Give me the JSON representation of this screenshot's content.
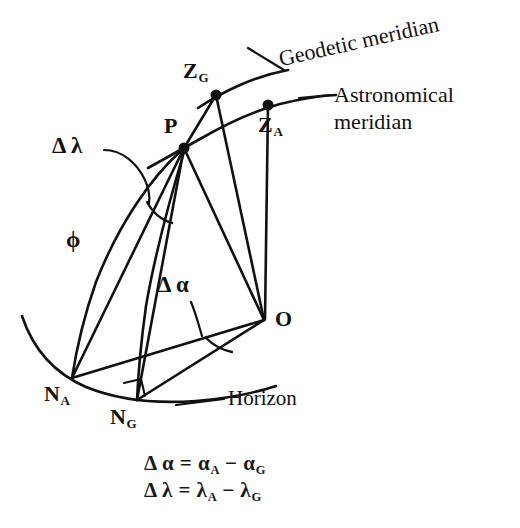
{
  "figure": {
    "background_color": "#ffffff",
    "ink_color": "#111111",
    "points": [
      {
        "id": "P",
        "label": "P",
        "sub": "",
        "x": 184,
        "y": 148
      },
      {
        "id": "ZG",
        "label": "Z",
        "sub": "G",
        "x": 216,
        "y": 95
      },
      {
        "id": "ZA",
        "label": "Z",
        "sub": "A",
        "x": 268,
        "y": 105
      },
      {
        "id": "O",
        "label": "O",
        "sub": "",
        "x": 264,
        "y": 320
      },
      {
        "id": "NA",
        "label": "N",
        "sub": "A",
        "x": 72,
        "y": 378
      },
      {
        "id": "NG",
        "label": "N",
        "sub": "G",
        "x": 137,
        "y": 400
      }
    ],
    "annotations": {
      "delta_lambda": "Δ λ",
      "delta_alpha": "Δ α",
      "phi": "ϕ"
    },
    "callouts": {
      "geodetic_meridian": "Geodetic meridian",
      "astronomical_meridian_line1": "Astronomical",
      "astronomical_meridian_line2": "meridian",
      "horizon": "Horizon"
    },
    "equations": [
      {
        "lhs_symbol": "Δ α",
        "eq": "=",
        "term1": "α",
        "term1_sub": "A",
        "minus": "−",
        "term2": "α",
        "term2_sub": "G"
      },
      {
        "lhs_symbol": "Δ λ",
        "eq": "=",
        "term1": "λ",
        "term1_sub": "A",
        "minus": "−",
        "term2": "λ",
        "term2_sub": "G"
      }
    ]
  }
}
